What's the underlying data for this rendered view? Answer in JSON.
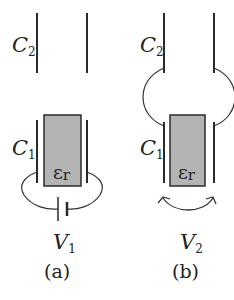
{
  "panels": [
    {
      "id": "a",
      "caption": "(a)",
      "upper_capacitor": {
        "symbol": "C",
        "subscript": "2"
      },
      "lower_capacitor": {
        "symbol": "C",
        "subscript": "1"
      },
      "dielectric": {
        "symbol": "ε",
        "subscript": "r"
      },
      "source": {
        "symbol": "V",
        "subscript": "1",
        "type": "battery"
      }
    },
    {
      "id": "b",
      "caption": "(b)",
      "upper_capacitor": {
        "symbol": "C",
        "subscript": "2"
      },
      "lower_capacitor": {
        "symbol": "C",
        "subscript": "1"
      },
      "dielectric": {
        "symbol": "ε",
        "subscript": "r"
      },
      "source": {
        "symbol": "V",
        "subscript": "2",
        "type": "curved-double-arrow"
      }
    }
  ],
  "colors": {
    "plate": "#2a2a2a",
    "dielectric_fill": "#b4b4b4",
    "background": "#ffffff"
  }
}
